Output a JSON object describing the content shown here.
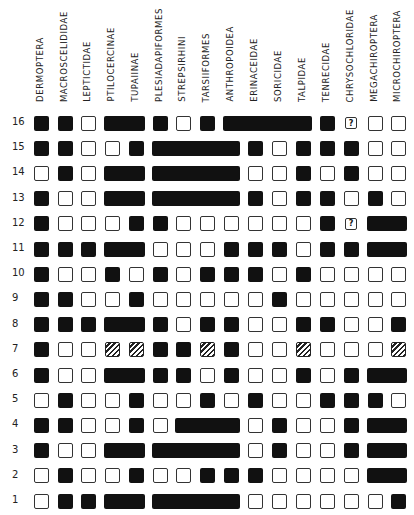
{
  "columns": [
    "DERMOPTERA",
    "MACROSCELIDIDAE",
    "LEPTICTIDAE",
    "PTILOCERCINAE",
    "TUPAIINAE",
    "PLESIADAPIFORMES",
    "STREPSIRHINI",
    "TARSIIFORMES",
    "ANTHROPOIDEA",
    "ERINACEIDAE",
    "SORICIDAE",
    "TALPIDAE",
    "TENRECIDAE",
    "CHRYSOCHLORIDAE",
    "MEGACHIROPTERA",
    "MICROCHIROPTERA"
  ],
  "legend_symbols": {
    "F": "filled square (character present)",
    "E": "empty square (character absent)",
    "H": "hatched square (intermediate)",
    "Q": "question mark (unknown)",
    "bar": "connected filled bar spanning adjacent taxa"
  },
  "rows": [
    {
      "label": "16",
      "cells": "F F E F F F E F E F F F F Q E E",
      "bars": [
        [
          4,
          5
        ],
        [
          9,
          12
        ]
      ]
    },
    {
      "label": "15",
      "cells": "F F E E F F F F F F E F F F E E",
      "bars": [
        [
          6,
          9
        ]
      ]
    },
    {
      "label": "14",
      "cells": "E F E F F F F F F E E F E F E E",
      "bars": [
        [
          4,
          5
        ],
        [
          6,
          9
        ]
      ]
    },
    {
      "label": "13",
      "cells": "F E E F F F F F F F E F F E F E",
      "bars": [
        [
          4,
          5
        ],
        [
          6,
          9
        ]
      ]
    },
    {
      "label": "12",
      "cells": "F E E E F F E E E E E E F Q F F",
      "bars": [
        [
          15,
          16
        ]
      ]
    },
    {
      "label": "11",
      "cells": "F F F F F E E E F F F E F F F F",
      "bars": [
        [
          4,
          5
        ],
        [
          15,
          16
        ]
      ]
    },
    {
      "label": "10",
      "cells": "F E E F E F E F F F E F E E E E",
      "bars": []
    },
    {
      "label": "9",
      "cells": "F F E E F E E E E E F E E E E E",
      "bars": []
    },
    {
      "label": "8",
      "cells": "F F F F F F E F F E E F F E E F",
      "bars": [
        [
          4,
          5
        ]
      ]
    },
    {
      "label": "7",
      "cells": "F E E H H F F H F E E H E E E H",
      "bars": []
    },
    {
      "label": "6",
      "cells": "F E E F F F F E F E E F E F F F",
      "bars": [
        [
          4,
          5
        ],
        [
          15,
          16
        ]
      ]
    },
    {
      "label": "5",
      "cells": "E F E E F E E F E F E E F F F E",
      "bars": []
    },
    {
      "label": "4",
      "cells": "F F E E F E F F F E F E E F F F",
      "bars": [
        [
          7,
          9
        ],
        [
          15,
          16
        ]
      ]
    },
    {
      "label": "3",
      "cells": "F E E F F F F F F E F E E F F F",
      "bars": [
        [
          4,
          5
        ],
        [
          6,
          9
        ],
        [
          15,
          16
        ]
      ]
    },
    {
      "label": "2",
      "cells": "E F E E F E E F F F E E E E F F",
      "bars": [
        [
          15,
          16
        ]
      ]
    },
    {
      "label": "1",
      "cells": "E F F F F F F F F E E E E E E F",
      "bars": [
        [
          4,
          5
        ],
        [
          6,
          9
        ]
      ]
    }
  ],
  "question_mark": "?",
  "colors": {
    "filled": "#111111",
    "outline": "#333333",
    "background": "#ffffff"
  }
}
